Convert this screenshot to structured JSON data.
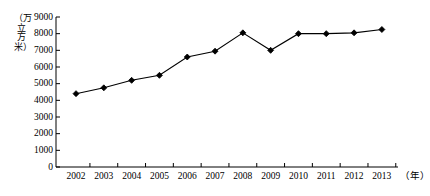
{
  "chart_data": {
    "type": "line",
    "title": "",
    "subtitle": "",
    "xlabel": "（年）",
    "ylabel": "（万立方米）",
    "categories": [
      "2002",
      "2003",
      "2004",
      "2005",
      "2006",
      "2007",
      "2008",
      "2009",
      "2010",
      "2011",
      "2012",
      "2013"
    ],
    "values": [
      4400,
      4750,
      5200,
      5500,
      6600,
      6950,
      8050,
      7000,
      8000,
      8000,
      8050,
      8250
    ],
    "series": [
      {
        "name": "供水量",
        "values": [
          4400,
          4750,
          5200,
          5500,
          6600,
          6950,
          8050,
          7000,
          8000,
          8000,
          8050,
          8250
        ]
      }
    ],
    "ylim": [
      0,
      9000
    ],
    "ytick_labels": [
      "0",
      "1000",
      "2000",
      "3000",
      "4000",
      "5000",
      "6000",
      "7000",
      "8000",
      "9000"
    ],
    "ytick_values": [
      0,
      1000,
      2000,
      3000,
      4000,
      5000,
      6000,
      7000,
      8000,
      9000
    ],
    "grid": false,
    "legend": false,
    "legend_position": "none",
    "marker": "diamond",
    "line_color": "#000000",
    "marker_color": "#000000",
    "axis_color": "#000000",
    "background_color": "#ffffff",
    "annotations": []
  },
  "axes": {
    "y_unit_text": "（万立方米）",
    "x_unit_text": "（年）"
  }
}
